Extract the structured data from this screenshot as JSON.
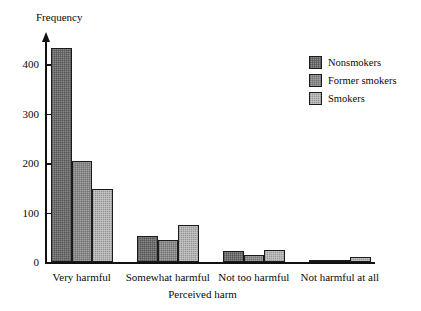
{
  "chart_data": {
    "type": "bar",
    "title": "",
    "xlabel": "Perceived harm",
    "ylabel": "Frequency",
    "categories": [
      "Very harmful",
      "Somewhat harmful",
      "Not too harmful",
      "Not harmful at all"
    ],
    "series": [
      {
        "name": "Nonsmokers",
        "color": "#6b6b6b",
        "values": [
          433,
          53,
          23,
          5
        ]
      },
      {
        "name": "Former smokers",
        "color": "#8a8a8a",
        "values": [
          205,
          45,
          15,
          4
        ]
      },
      {
        "name": "Smokers",
        "color": "#b5b5b5",
        "values": [
          147,
          75,
          25,
          11
        ]
      }
    ],
    "yticks": [
      0,
      100,
      200,
      300,
      400
    ],
    "ytick_labels": [
      "0",
      "100",
      "200",
      "300",
      "400"
    ],
    "ylim": [
      0,
      450
    ],
    "grid": false,
    "legend_position": "top-right",
    "axis_color": "#111111"
  }
}
